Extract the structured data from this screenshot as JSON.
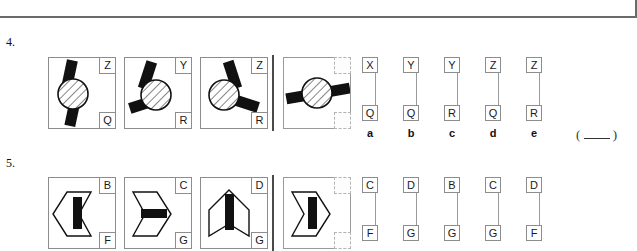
{
  "page": {
    "width": 637,
    "height": 244,
    "background": "#ffffff",
    "ink": "#1a1a1a",
    "rule_color": "#6b6b6b"
  },
  "questions": [
    {
      "number": "4.",
      "stimuli": [
        {
          "figure": "hatched-circle-one-bar-vertical",
          "top_label": "Z",
          "bottom_label": "Q"
        },
        {
          "figure": "hatched-circle-two-bars-left",
          "top_label": "Y",
          "bottom_label": "R"
        },
        {
          "figure": "hatched-circle-two-bars-right",
          "top_label": "Z",
          "bottom_label": "R"
        }
      ],
      "query": {
        "figure": "hatched-circle-bar-horizontal",
        "top_label": "",
        "bottom_label": ""
      },
      "options": [
        {
          "letter": "a",
          "top_label": "X",
          "bottom_label": "Q"
        },
        {
          "letter": "b",
          "top_label": "Y",
          "bottom_label": "Q"
        },
        {
          "letter": "c",
          "top_label": "Y",
          "bottom_label": "R"
        },
        {
          "letter": "d",
          "top_label": "Z",
          "bottom_label": "Q"
        },
        {
          "letter": "e",
          "top_label": "Z",
          "bottom_label": "R"
        }
      ],
      "answer_blank": "(          )"
    },
    {
      "number": "5.",
      "stimuli": [
        {
          "figure": "chevron-left-vertical-bar",
          "top_label": "B",
          "bottom_label": "F"
        },
        {
          "figure": "chevron-right-horizontal-bar",
          "top_label": "C",
          "bottom_label": "G"
        },
        {
          "figure": "chevron-up-vertical-bar",
          "top_label": "D",
          "bottom_label": "G"
        }
      ],
      "query": {
        "figure": "chevron-right-vertical-bar",
        "top_label": "",
        "bottom_label": ""
      },
      "options": [
        {
          "letter": "a",
          "top_label": "C",
          "bottom_label": "F"
        },
        {
          "letter": "b",
          "top_label": "D",
          "bottom_label": "G"
        },
        {
          "letter": "c",
          "top_label": "B",
          "bottom_label": "G"
        },
        {
          "letter": "d",
          "top_label": "C",
          "bottom_label": "G"
        },
        {
          "letter": "e",
          "top_label": "D",
          "bottom_label": "F"
        }
      ],
      "answer_blank": ""
    }
  ]
}
